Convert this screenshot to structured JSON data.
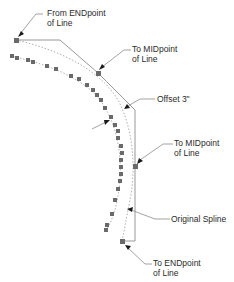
{
  "diagram": {
    "colors": {
      "background": "#ffffff",
      "line": "#8c8c8c",
      "dotted_curve": "#9a9a9a",
      "marker": "#6a6a6a",
      "arrowhead": "#1a1a1a",
      "text": "#2a2a2a"
    },
    "labels": {
      "from_endpoint": {
        "line1": "From ENDpoint",
        "line2": "of Line"
      },
      "to_midpoint_top": {
        "line1": "To MIDpoint",
        "line2": "of Line"
      },
      "offset": {
        "line1": "Offset 3\""
      },
      "to_midpoint_right": {
        "line1": "To MIDpoint",
        "line2": "of Line"
      },
      "original_spline": {
        "line1": "Original Spline"
      },
      "to_endpoint": {
        "line1": "To ENDpoint",
        "line2": "of Line"
      }
    },
    "points": {
      "start": [
        16,
        40
      ],
      "mid_top": [
        98,
        73
      ],
      "corner": [
        135,
        110
      ],
      "mid_right": [
        135,
        166
      ],
      "bottom_corner": [
        135,
        241
      ],
      "end": [
        122,
        241
      ]
    },
    "offset_markers": [
      [
        12,
        56
      ],
      [
        17,
        58
      ],
      [
        28,
        60
      ],
      [
        33,
        62
      ],
      [
        47,
        66
      ],
      [
        56,
        69
      ],
      [
        71,
        76
      ],
      [
        79,
        79
      ],
      [
        87,
        85
      ],
      [
        93,
        90
      ],
      [
        97,
        95
      ],
      [
        101,
        100
      ],
      [
        105,
        108
      ],
      [
        111,
        117
      ],
      [
        115,
        125
      ],
      [
        118,
        131
      ],
      [
        118,
        138
      ],
      [
        121,
        146
      ],
      [
        122,
        153
      ],
      [
        121,
        160
      ],
      [
        121,
        167
      ],
      [
        121,
        174
      ],
      [
        120,
        181
      ],
      [
        118,
        189
      ],
      [
        115,
        200
      ],
      [
        112,
        214
      ],
      [
        107,
        225
      ],
      [
        106,
        230
      ]
    ]
  }
}
